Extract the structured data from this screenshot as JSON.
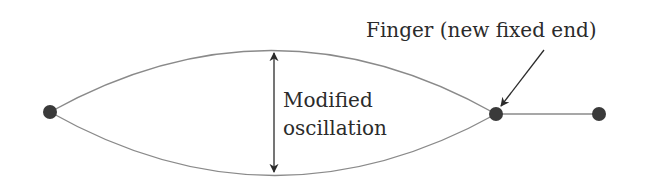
{
  "diagram": {
    "labels": {
      "finger": "Finger (new fixed end)",
      "oscillation_line1": "Modified",
      "oscillation_line2": "oscillation"
    },
    "nodes": [
      {
        "id": "left-fixed-end",
        "x": 50,
        "y": 112
      },
      {
        "id": "finger",
        "x": 496,
        "y": 114
      },
      {
        "id": "right-end",
        "x": 599,
        "y": 114
      }
    ],
    "colors": {
      "string": "#8a8a8a",
      "node": "#3a3a3a",
      "arrow": "#2b2b2b",
      "text": "#2b2b2b"
    }
  }
}
